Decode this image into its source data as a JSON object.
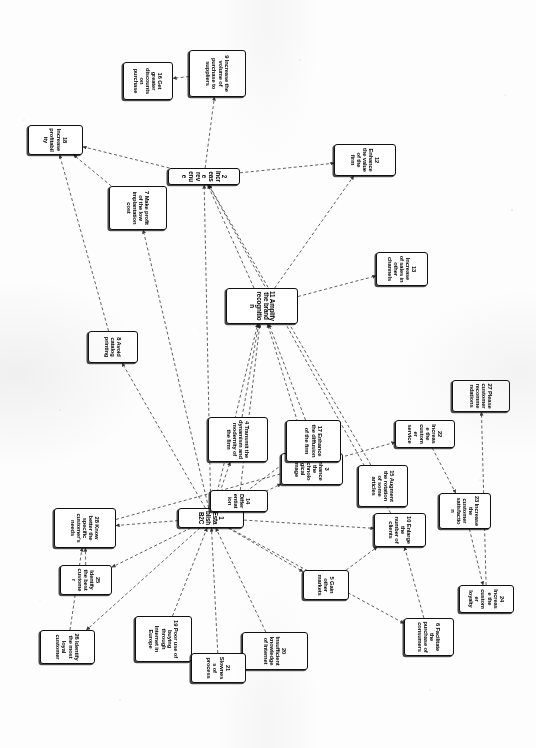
{
  "document": {
    "kind": "scanned-diagram",
    "orientation": "rotated-90-clockwise",
    "title": "B2C strategic objectives cause-and-effect map",
    "background_color": "#ffffff",
    "ink_color": "#101010"
  },
  "diagram": {
    "type": "node-link causal map",
    "link_style": "dashed arrow",
    "nodes": [
      {
        "id": "n1",
        "number": "1",
        "label": "1 Establish B2C",
        "x": 508,
        "y": 292,
        "w": 20,
        "h": 66,
        "size": "m"
      },
      {
        "id": "n2",
        "number": "2",
        "label": "2 Increase revenue",
        "x": 168,
        "y": 296,
        "w": 17,
        "h": 72,
        "size": "m"
      },
      {
        "id": "n3",
        "number": "3",
        "label": "3 Enhance the technological image",
        "x": 453,
        "y": 193,
        "w": 32,
        "h": 62,
        "size": "s"
      },
      {
        "id": "n4",
        "number": "4",
        "label": "4 Transmit the dynamism and modernity of the firm",
        "x": 417,
        "y": 268,
        "w": 45,
        "h": 60,
        "size": "s"
      },
      {
        "id": "n5",
        "number": "5",
        "label": "5 Gain other markets",
        "x": 570,
        "y": 187,
        "w": 30,
        "h": 46,
        "size": "s"
      },
      {
        "id": "n6",
        "number": "6",
        "label": "6 Facilitate the purchase of consumers",
        "x": 618,
        "y": 82,
        "w": 38,
        "h": 50,
        "size": "s"
      },
      {
        "id": "n7",
        "number": "7",
        "label": "7 Make profit of the low implantation cost",
        "x": 186,
        "y": 369,
        "w": 44,
        "h": 58,
        "size": "s"
      },
      {
        "id": "n8",
        "number": "8",
        "label": "8 Avoid catalog printing",
        "x": 331,
        "y": 398,
        "w": 32,
        "h": 50,
        "size": "s"
      },
      {
        "id": "n9",
        "number": "9",
        "label": "9 Increase the volume of purchase to suppliers",
        "x": 50,
        "y": 290,
        "w": 47,
        "h": 57,
        "size": "s"
      },
      {
        "id": "n10",
        "number": "10",
        "label": "10 Enlarge the number of clients",
        "x": 513,
        "y": 110,
        "w": 34,
        "h": 52,
        "size": "s"
      },
      {
        "id": "n11",
        "number": "11",
        "label": "11 Amplify the brand recognition",
        "x": 288,
        "y": 238,
        "w": 36,
        "h": 72,
        "size": "m"
      },
      {
        "id": "n12",
        "number": "12",
        "label": "12 Enhance the value of the firm",
        "x": 144,
        "y": 140,
        "w": 32,
        "h": 62,
        "size": "s"
      },
      {
        "id": "n13",
        "number": "13",
        "label": "13 Increase of sales in other channels",
        "x": 252,
        "y": 108,
        "w": 34,
        "h": 52,
        "size": "s"
      },
      {
        "id": "n14",
        "number": "14",
        "label": "14 Differentiation",
        "x": 490,
        "y": 268,
        "w": 22,
        "h": 58,
        "size": "s"
      },
      {
        "id": "n15",
        "number": "15",
        "label": "15 Augment the rotation of some articles",
        "x": 465,
        "y": 128,
        "w": 42,
        "h": 50,
        "size": "s"
      },
      {
        "id": "n16",
        "number": "16",
        "label": "16 Get greater discounts on purchase",
        "x": 62,
        "y": 363,
        "w": 38,
        "h": 50,
        "size": "s"
      },
      {
        "id": "n17",
        "number": "17",
        "label": "17 Enhance the diffusion of the firm",
        "x": 420,
        "y": 195,
        "w": 42,
        "h": 55,
        "size": "s"
      },
      {
        "id": "n18",
        "number": "18",
        "label": "18 Increase profitability",
        "x": 125,
        "y": 453,
        "w": 30,
        "h": 55,
        "size": "s"
      },
      {
        "id": "n19",
        "number": "19",
        "label": "19 Poor use of buying through Internet in Europe",
        "x": 616,
        "y": 344,
        "w": 46,
        "h": 57,
        "size": "s"
      },
      {
        "id": "n20",
        "number": "20",
        "label": "20 Insufficient knowledge of Internet",
        "x": 632,
        "y": 228,
        "w": 38,
        "h": 66,
        "size": "s"
      },
      {
        "id": "n21",
        "number": "21",
        "label": "21 Slowness of process",
        "x": 653,
        "y": 290,
        "w": 30,
        "h": 55,
        "size": "s"
      },
      {
        "id": "n22",
        "number": "22",
        "label": "22 Increase the customer service",
        "x": 420,
        "y": 81,
        "w": 28,
        "h": 60,
        "size": "s"
      },
      {
        "id": "n23",
        "number": "23",
        "label": "23 Increase the customer satisfaction",
        "x": 493,
        "y": 45,
        "w": 36,
        "h": 52,
        "size": "s"
      },
      {
        "id": "n24",
        "number": "24",
        "label": "24 Increase the customer loyalty",
        "x": 585,
        "y": 22,
        "w": 28,
        "h": 55,
        "size": "s"
      },
      {
        "id": "n25",
        "number": "25",
        "label": "25 Identify the best customer",
        "x": 565,
        "y": 424,
        "w": 30,
        "h": 52,
        "size": "s"
      },
      {
        "id": "n26",
        "number": "26",
        "label": "26 Identify the most loyal customer",
        "x": 630,
        "y": 441,
        "w": 34,
        "h": 55,
        "size": "s"
      },
      {
        "id": "n27",
        "number": "27",
        "label": "27 Please customer recommendations",
        "x": 380,
        "y": 26,
        "w": 32,
        "h": 58,
        "size": "s"
      },
      {
        "id": "n28",
        "number": "28",
        "label": "28 Know better the specific customer's needs",
        "x": 508,
        "y": 420,
        "w": 40,
        "h": 62,
        "size": "s"
      }
    ],
    "links": [
      {
        "from": "n1",
        "to": "n11"
      },
      {
        "from": "n1",
        "to": "n2"
      },
      {
        "from": "n1",
        "to": "n3"
      },
      {
        "from": "n1",
        "to": "n4"
      },
      {
        "from": "n1",
        "to": "n5"
      },
      {
        "from": "n1",
        "to": "n14"
      },
      {
        "from": "n1",
        "to": "n17"
      },
      {
        "from": "n1",
        "to": "n28"
      },
      {
        "from": "n1",
        "to": "n25"
      },
      {
        "from": "n1",
        "to": "n26"
      },
      {
        "from": "n1",
        "to": "n8"
      },
      {
        "from": "n1",
        "to": "n7"
      },
      {
        "from": "n1",
        "to": "n10"
      },
      {
        "from": "n1",
        "to": "n6"
      },
      {
        "from": "n2",
        "to": "n12"
      },
      {
        "from": "n2",
        "to": "n18"
      },
      {
        "from": "n2",
        "to": "n9"
      },
      {
        "from": "n9",
        "to": "n16"
      },
      {
        "from": "n7",
        "to": "n18"
      },
      {
        "from": "n8",
        "to": "n18"
      },
      {
        "from": "n11",
        "to": "n2"
      },
      {
        "from": "n11",
        "to": "n12"
      },
      {
        "from": "n11",
        "to": "n13"
      },
      {
        "from": "n3",
        "to": "n11"
      },
      {
        "from": "n4",
        "to": "n11"
      },
      {
        "from": "n17",
        "to": "n11"
      },
      {
        "from": "n14",
        "to": "n11"
      },
      {
        "from": "n15",
        "to": "n2"
      },
      {
        "from": "n10",
        "to": "n2"
      },
      {
        "from": "n5",
        "to": "n10"
      },
      {
        "from": "n6",
        "to": "n10"
      },
      {
        "from": "n22",
        "to": "n23"
      },
      {
        "from": "n23",
        "to": "n24"
      },
      {
        "from": "n24",
        "to": "n27"
      },
      {
        "from": "n28",
        "to": "n22"
      },
      {
        "from": "n25",
        "to": "n28"
      },
      {
        "from": "n26",
        "to": "n28"
      },
      {
        "from": "n20",
        "to": "n1"
      },
      {
        "from": "n21",
        "to": "n1"
      },
      {
        "from": "n19",
        "to": "n1"
      }
    ]
  }
}
